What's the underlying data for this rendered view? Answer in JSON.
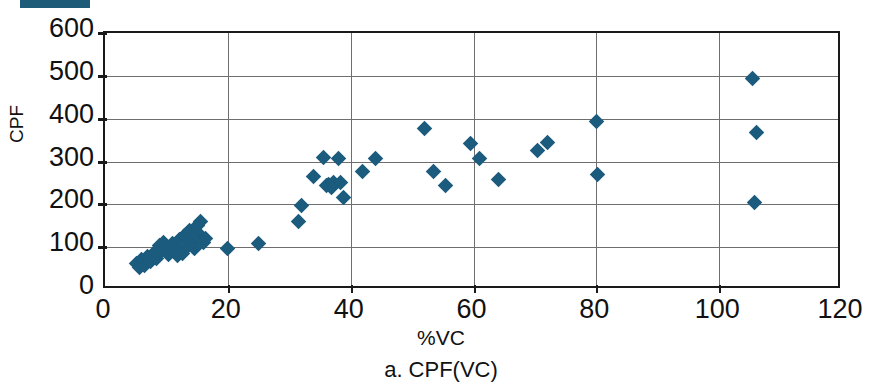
{
  "figure": {
    "caption": "a.  CPF(VC)",
    "top_marker_bar": {
      "name": "clipped-legend-bar",
      "color": "#1d5b79"
    }
  },
  "chart_data": {
    "type": "scatter",
    "title": "",
    "xlabel": "%VC",
    "ylabel": "CPF",
    "xlim": [
      0,
      120
    ],
    "ylim": [
      0,
      600
    ],
    "xticks": [
      0,
      20,
      40,
      60,
      80,
      100,
      120
    ],
    "yticks": [
      0,
      100,
      200,
      300,
      400,
      500,
      600
    ],
    "grid": "horizontal-and-vertical",
    "legend": "none",
    "marker": {
      "shape": "diamond",
      "color": "#1b5b7e",
      "size_px": 11
    },
    "series": [
      {
        "name": "CPF(VC)",
        "points": [
          [
            5.2,
            62
          ],
          [
            5.6,
            52
          ],
          [
            6.0,
            72
          ],
          [
            6.4,
            58
          ],
          [
            7.0,
            78
          ],
          [
            7.4,
            66
          ],
          [
            8.0,
            88
          ],
          [
            8.4,
            74
          ],
          [
            8.8,
            104
          ],
          [
            9.2,
            92
          ],
          [
            9.6,
            112
          ],
          [
            10.0,
            98
          ],
          [
            10.4,
            84
          ],
          [
            11.0,
            108
          ],
          [
            11.4,
            95
          ],
          [
            11.8,
            80
          ],
          [
            12.2,
            118
          ],
          [
            12.6,
            86
          ],
          [
            13.0,
            128
          ],
          [
            13.4,
            102
          ],
          [
            13.8,
            140
          ],
          [
            14.2,
            112
          ],
          [
            14.6,
            96
          ],
          [
            15.0,
            150
          ],
          [
            15.2,
            132
          ],
          [
            15.6,
            160
          ],
          [
            16.0,
            110
          ],
          [
            16.4,
            120
          ],
          [
            20.0,
            97
          ],
          [
            25.0,
            108
          ],
          [
            31.5,
            160
          ],
          [
            32.0,
            198
          ],
          [
            34.0,
            264
          ],
          [
            35.5,
            309
          ],
          [
            36.0,
            243
          ],
          [
            36.4,
            246
          ],
          [
            36.8,
            240
          ],
          [
            37.2,
            252
          ],
          [
            38.0,
            307
          ],
          [
            38.4,
            252
          ],
          [
            38.8,
            216
          ],
          [
            42.0,
            276
          ],
          [
            44.0,
            307
          ],
          [
            52.0,
            376
          ],
          [
            53.5,
            276
          ],
          [
            55.5,
            243
          ],
          [
            59.5,
            341
          ],
          [
            61.0,
            307
          ],
          [
            64.0,
            257
          ],
          [
            70.5,
            325
          ],
          [
            72.0,
            344
          ],
          [
            80.0,
            393
          ],
          [
            80.2,
            269
          ],
          [
            105.5,
            493
          ],
          [
            106.0,
            368
          ],
          [
            105.8,
            205
          ]
        ]
      }
    ]
  },
  "axes": {
    "y_tick_labels": [
      "600",
      "500",
      "400",
      "300",
      "200",
      "100",
      "0"
    ],
    "x_tick_labels": [
      "0",
      "20",
      "40",
      "60",
      "80",
      "100",
      "120"
    ],
    "y_title": "CPF",
    "x_title": "%VC"
  }
}
